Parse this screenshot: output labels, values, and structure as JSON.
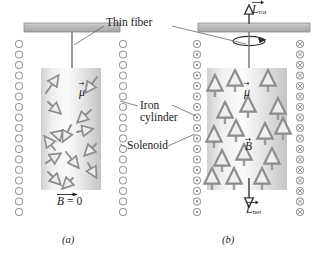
{
  "figure": {
    "labels": {
      "thin_fiber": "Thin fiber",
      "iron_line1": "Iron",
      "iron_line2": "cylinder",
      "solenoid": "Solenoid"
    },
    "captions": {
      "panel_a": "(a)",
      "panel_b": "(b)"
    },
    "colors": {
      "support_bar": "#b9b9b9",
      "support_bar_edge": "#8f8f8f",
      "cylinder_light": "#f2f2f2",
      "cylinder_mid": "#d9d9d9",
      "cylinder_dark": "#c2c2c2",
      "arrow_gray": "#8d8d8d",
      "arrow_fill": "#e8e8e8",
      "coil_stroke": "#9a9a9a",
      "leader_line": "#6e6e6e",
      "text": "#1a1a1a"
    }
  },
  "panel_a": {
    "name": "Panel a - no current, random magnetic moments",
    "state": "solenoid off",
    "b_field_label": "B",
    "b_field_value": "= 0",
    "moment_label": "μ",
    "coil_marker": "empty-circle",
    "coil_marker_meaning": "no current",
    "coil_turns_per_side": 16,
    "moment_count": 14,
    "moment_orientation": "random"
  },
  "panel_b": {
    "name": "Panel b - current on, aligned magnetic moments, cylinder rotates",
    "state": "solenoid on",
    "moment_label": "μ",
    "b_field_label": "B",
    "angular_momentum_rot_label": "L",
    "angular_momentum_rot_sub": "rot",
    "angular_momentum_net_label": "L",
    "angular_momentum_net_sub": "net",
    "coil_marker_left": "dot-in-circle",
    "coil_marker_left_meaning": "current out of page",
    "coil_marker_right": "cross-in-circle",
    "coil_marker_right_meaning": "current into page",
    "coil_turns_per_side": 16,
    "moment_count": 16,
    "moment_orientation": "aligned upward",
    "rotation_indicator": "clockwise ellipse arrow about fiber axis"
  }
}
